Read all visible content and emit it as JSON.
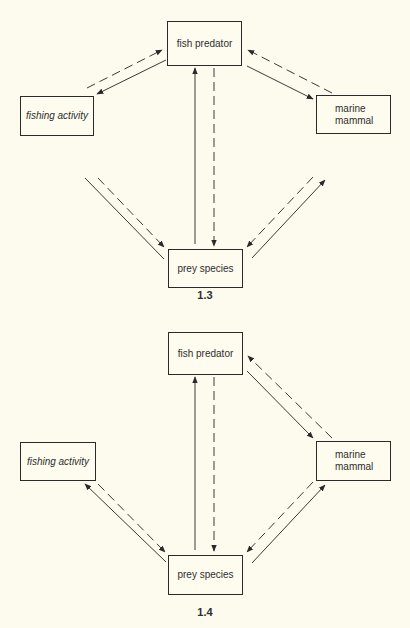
{
  "diagrams": [
    {
      "label": "1.3",
      "nodes": {
        "fish_predator": "fish predator",
        "fishing_activity": "fishing activity",
        "marine_mammal": "marine\nmammal",
        "prey_species": "prey species"
      },
      "edges": [
        {
          "from": "fishing_activity",
          "to": "fish_predator",
          "style": "dashed",
          "arrow": "end"
        },
        {
          "from": "fish_predator",
          "to": "fishing_activity",
          "style": "solid",
          "arrow": "end"
        },
        {
          "from": "marine_mammal",
          "to": "fish_predator",
          "style": "dashed",
          "arrow": "end"
        },
        {
          "from": "fish_predator",
          "to": "marine_mammal",
          "style": "solid",
          "arrow": "end"
        },
        {
          "from": "prey_species",
          "to": "fish_predator",
          "style": "solid",
          "arrow": "end"
        },
        {
          "from": "fish_predator",
          "to": "prey_species",
          "style": "dashed",
          "arrow": "end"
        },
        {
          "from": "fishing_activity",
          "to": "prey_species",
          "style": "solid",
          "arrow": "none"
        },
        {
          "from": "fishing_activity",
          "to": "prey_species",
          "style": "dashed",
          "arrow": "end"
        },
        {
          "from": "marine_mammal",
          "to": "prey_species",
          "style": "dashed",
          "arrow": "end"
        },
        {
          "from": "prey_species",
          "to": "marine_mammal",
          "style": "solid",
          "arrow": "end"
        }
      ]
    },
    {
      "label": "1.4",
      "nodes": {
        "fish_predator": "fish predator",
        "fishing_activity": "fishing activity",
        "marine_mammal": "marine\nmammal",
        "prey_species": "prey species"
      },
      "edges": [
        {
          "from": "marine_mammal",
          "to": "fish_predator",
          "style": "dashed",
          "arrow": "end"
        },
        {
          "from": "fish_predator",
          "to": "marine_mammal",
          "style": "solid",
          "arrow": "end"
        },
        {
          "from": "prey_species",
          "to": "fish_predator",
          "style": "solid",
          "arrow": "end"
        },
        {
          "from": "fish_predator",
          "to": "prey_species",
          "style": "dashed",
          "arrow": "end"
        },
        {
          "from": "prey_species",
          "to": "fishing_activity",
          "style": "solid",
          "arrow": "end"
        },
        {
          "from": "fishing_activity",
          "to": "prey_species",
          "style": "dashed",
          "arrow": "end"
        },
        {
          "from": "marine_mammal",
          "to": "prey_species",
          "style": "dashed",
          "arrow": "end"
        },
        {
          "from": "prey_species",
          "to": "marine_mammal",
          "style": "solid",
          "arrow": "end"
        }
      ]
    }
  ],
  "colors": {
    "background": "#fcfbed",
    "ink": "#2a2a2a"
  }
}
